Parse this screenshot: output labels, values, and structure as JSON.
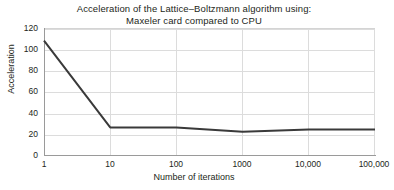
{
  "chart_data": {
    "type": "line",
    "title": "Acceleration of the Lattice–Boltzmann algorithm using: Maxeler card compared to CPU",
    "title_lines": [
      "Acceleration of the Lattice–Boltzmann algorithm using:",
      "Maxeler card compared to CPU"
    ],
    "xlabel": "Number of iterations",
    "ylabel": "Acceleration",
    "categories": [
      "1",
      "10",
      "100",
      "1000",
      "10,000",
      "100,000"
    ],
    "x": [
      1,
      10,
      100,
      1000,
      10000,
      100000
    ],
    "values": [
      108,
      26,
      26,
      22,
      24,
      24
    ],
    "series": [
      {
        "name": "Maxeler card compared to CPU",
        "values": [
          108,
          26,
          26,
          22,
          24,
          24
        ],
        "color": "#3a3a3a",
        "markers": false,
        "line_width": 2
      }
    ],
    "yticks": [
      0,
      20,
      40,
      60,
      80,
      100,
      120
    ],
    "ytick_labels": [
      "0",
      "20",
      "40",
      "60",
      "80",
      "100",
      "120"
    ],
    "ylim": [
      0,
      120
    ],
    "xscale": "log",
    "grid": true,
    "grid_color": "#dcdcdc",
    "legend": false,
    "legend_position": "none",
    "background": "#ffffff",
    "axis_color": "#9a9a9a",
    "text_color": "#231f20"
  }
}
